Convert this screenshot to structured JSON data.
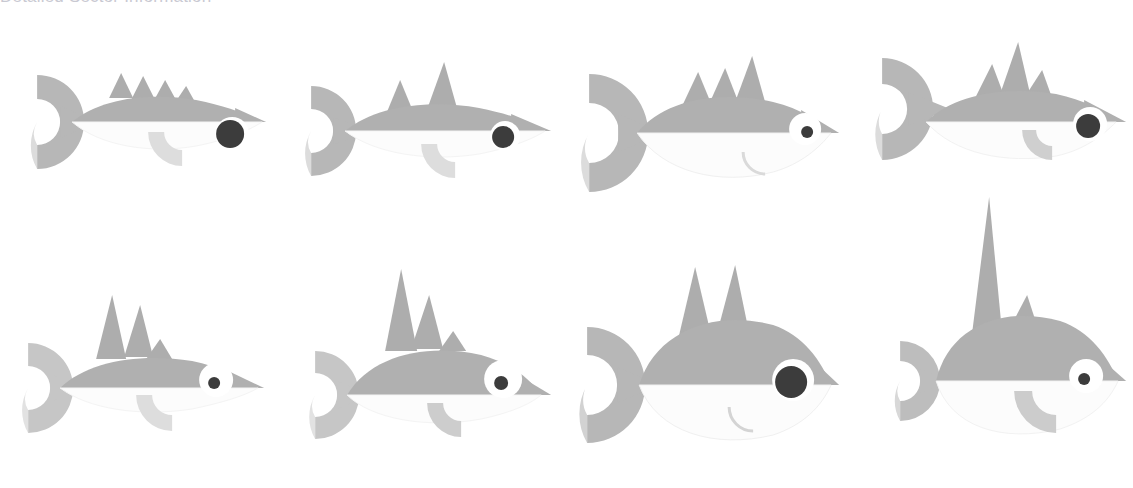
{
  "page": {
    "heading": "Detailed Sector Information",
    "heading_color": "#c9c9d2",
    "background": "#ffffff"
  },
  "palette": {
    "body_upper": "#b0b0b0",
    "body_lower": "#fafafa",
    "tail_upper": "#b7b7b7",
    "tail_lower": "#dcdcdc",
    "fin_upper": "#adadad",
    "fin_lower": "#d6d6d6",
    "eye_dark": "#3c3c3c",
    "eye_white": "#ffffff",
    "smile_stroke": "#d8d8d8",
    "belly_outline": "#f1f1f1"
  },
  "figures": [
    {
      "id": "fish-1",
      "label": "slim fish with four small dorsal fins and large dark eye",
      "row": 1,
      "column": 1,
      "body_style": "slim",
      "dorsal_fins": 4,
      "fin_height": "short",
      "tail_size": "small",
      "eye_size": "large",
      "eye_type": "dark",
      "has_smile": false,
      "body_fill": "#b0b0b0",
      "eye_fill": "#3c3c3c"
    },
    {
      "id": "fish-2",
      "label": "slim fish with two dorsal fins and ringed dark eye",
      "row": 1,
      "column": 2,
      "body_style": "slim",
      "dorsal_fins": 2,
      "fin_height": "medium",
      "tail_size": "small",
      "eye_size": "medium",
      "eye_type": "ringed-dark",
      "has_smile": false,
      "body_fill": "#b0b0b0",
      "eye_fill": "#3c3c3c"
    },
    {
      "id": "fish-3",
      "label": "plump fish with three dorsal fins, large tail and small pupil",
      "row": 1,
      "column": 3,
      "body_style": "plump",
      "dorsal_fins": 3,
      "fin_height": "medium",
      "tail_size": "large",
      "eye_size": "small",
      "eye_type": "white-pupil",
      "has_smile": true,
      "body_fill": "#b0b0b0",
      "eye_fill": "#3c3c3c"
    },
    {
      "id": "fish-4",
      "label": "medium fish with three dorsal fins and ringed dark eye",
      "row": 1,
      "column": 4,
      "body_style": "medium",
      "dorsal_fins": 3,
      "fin_height": "tall",
      "tail_size": "medium",
      "eye_size": "medium",
      "eye_type": "ringed-dark",
      "has_smile": false,
      "body_fill": "#b0b0b0",
      "eye_fill": "#3c3c3c"
    },
    {
      "id": "fish-5",
      "label": "slim fish with three tall dorsal fins and small white eye",
      "row": 2,
      "column": 1,
      "body_style": "slim",
      "dorsal_fins": 3,
      "fin_height": "tall",
      "tail_size": "small",
      "eye_size": "small",
      "eye_type": "white-pupil",
      "has_smile": false,
      "body_fill": "#b0b0b0",
      "eye_fill": "#3c3c3c"
    },
    {
      "id": "fish-6",
      "label": "medium fish with three tall dorsal fins and small white eye",
      "row": 2,
      "column": 2,
      "body_style": "medium",
      "dorsal_fins": 3,
      "fin_height": "tall",
      "tail_size": "small",
      "eye_size": "small",
      "eye_type": "white-pupil",
      "has_smile": false,
      "body_fill": "#b0b0b0",
      "eye_fill": "#3c3c3c"
    },
    {
      "id": "fish-7",
      "label": "round fish with two tall dorsal fins, big dark eye and smile",
      "row": 2,
      "column": 3,
      "body_style": "round",
      "dorsal_fins": 2,
      "fin_height": "tall",
      "tail_size": "large",
      "eye_size": "large",
      "eye_type": "ringed-dark",
      "has_smile": true,
      "body_fill": "#b0b0b0",
      "eye_fill": "#3c3c3c"
    },
    {
      "id": "fish-8",
      "label": "round fish with one very tall spike dorsal fin and small eye",
      "row": 2,
      "column": 4,
      "body_style": "round",
      "dorsal_fins": 2,
      "fin_height": "spike",
      "tail_size": "small",
      "eye_size": "small",
      "eye_type": "white-pupil",
      "has_smile": false,
      "body_fill": "#b0b0b0",
      "eye_fill": "#3c3c3c"
    }
  ]
}
